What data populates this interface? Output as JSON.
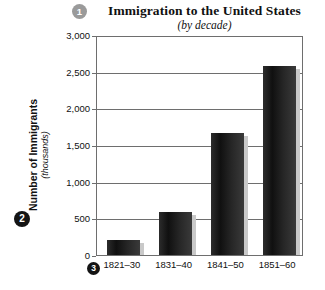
{
  "chart_data": {
    "type": "bar",
    "title": "Immigration to the United States",
    "subtitle": "(by decade)",
    "xlabel": "",
    "ylabel": "Number of Immigrants",
    "ylabel_sub": "(thousands)",
    "categories": [
      "1821–30",
      "1831–40",
      "1841–50",
      "1851–60"
    ],
    "values": [
      200,
      590,
      1670,
      2580
    ],
    "ylim": [
      0,
      3000
    ],
    "yticks": [
      0,
      500,
      1000,
      1500,
      2000,
      2500,
      3000
    ],
    "ytick_labels": [
      "0",
      "500",
      "1,000",
      "1,500",
      "2,000",
      "2,500",
      "3,000"
    ],
    "grid": true,
    "legend": false,
    "bar_color": "#1a1a1a",
    "shadow_color": "#c9c9c9"
  },
  "callouts": [
    {
      "id": "1",
      "label": "1",
      "color": "#9a9a9a",
      "target": "title"
    },
    {
      "id": "2",
      "label": "2",
      "color": "#141414",
      "target": "y-axis-label"
    },
    {
      "id": "3",
      "label": "3",
      "color": "#141414",
      "target": "x-axis-label"
    }
  ],
  "colors": {
    "axis": "#6e6e6e",
    "text": "#111111",
    "background": "#ffffff"
  }
}
